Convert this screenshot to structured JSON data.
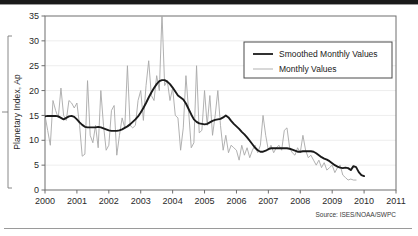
{
  "figure": {
    "source_note": "Source: ISES/NOAA/SWPC",
    "top_rule_color": "#1a1a1a",
    "rule_color": "#9a9a9a"
  },
  "chart_data": {
    "type": "line",
    "title": "",
    "subtitle": "",
    "xlabel": "",
    "ylabel": "Planetary Index, Ap",
    "xlim": [
      2000,
      2011
    ],
    "ylim": [
      0,
      35
    ],
    "xticks": [
      2000,
      2001,
      2002,
      2003,
      2004,
      2005,
      2006,
      2007,
      2008,
      2009,
      2010,
      2011
    ],
    "xtick_labels": [
      "2000",
      "2001",
      "2002",
      "2003",
      "2004",
      "2005",
      "2006",
      "2007",
      "2008",
      "2009",
      "2010",
      "2011"
    ],
    "yticks": [
      0,
      5,
      10,
      15,
      20,
      25,
      30,
      35
    ],
    "ytick_labels": [
      "0",
      "5",
      "10",
      "15",
      "20",
      "25",
      "30",
      "35"
    ],
    "grid": "horizontal",
    "grid_color": "#e8e8e8",
    "frame_color": "#6e6e6e",
    "legend_position": "upper-right",
    "legend_entries": [
      {
        "label": "Smoothed Monthly Values",
        "color": "#1a1a1a",
        "width": 1.8
      },
      {
        "label": "Monthly Values",
        "color": "#a8a8a8",
        "width": 0.9
      }
    ],
    "series": [
      {
        "name": "Monthly Values",
        "color": "#a8a8a8",
        "x_start": 2000.0,
        "x_step": 0.08333,
        "values": [
          15.0,
          12.0,
          9.0,
          18.0,
          16.0,
          14.5,
          20.5,
          15.0,
          14.0,
          18.0,
          17.5,
          16.5,
          17.5,
          13.0,
          6.8,
          7.2,
          22.0,
          11.0,
          9.5,
          13.0,
          8.5,
          20.0,
          13.0,
          8.0,
          9.0,
          16.0,
          17.0,
          7.0,
          11.0,
          14.5,
          12.5,
          25.0,
          13.0,
          12.5,
          13.0,
          18.0,
          20.0,
          14.0,
          21.0,
          26.0,
          19.0,
          18.0,
          23.0,
          20.0,
          35.5,
          21.0,
          22.0,
          18.0,
          20.5,
          15.0,
          14.5,
          8.0,
          12.5,
          23.0,
          16.0,
          8.5,
          9.5,
          25.0,
          11.5,
          12.0,
          20.0,
          13.0,
          19.0,
          11.0,
          15.0,
          20.0,
          13.0,
          8.0,
          11.0,
          7.5,
          9.0,
          8.5,
          8.0,
          6.0,
          9.0,
          7.0,
          8.5,
          6.5,
          8.0,
          9.0,
          7.5,
          9.0,
          15.0,
          11.0,
          8.0,
          9.0,
          7.5,
          8.5,
          9.0,
          8.0,
          12.0,
          12.5,
          8.5,
          7.5,
          7.0,
          8.5,
          7.5,
          11.0,
          8.0,
          6.5,
          7.0,
          6.0,
          5.0,
          6.0,
          4.5,
          5.5,
          4.0,
          4.5,
          5.0,
          3.5,
          4.5,
          5.0,
          3.0,
          2.5,
          2.0,
          2.2,
          2.0,
          2.0
        ]
      },
      {
        "name": "Smoothed Monthly Values",
        "color": "#1a1a1a",
        "x_start": 2000.0,
        "x_step": 0.08333,
        "values": [
          14.8,
          14.9,
          14.9,
          14.9,
          14.9,
          14.8,
          14.5,
          14.2,
          14.5,
          14.8,
          14.9,
          14.7,
          14.2,
          13.6,
          13.1,
          12.7,
          12.6,
          12.6,
          12.6,
          12.6,
          12.7,
          12.6,
          12.4,
          12.2,
          12.0,
          11.9,
          11.9,
          11.9,
          12.0,
          12.2,
          12.5,
          12.8,
          13.2,
          13.7,
          14.2,
          14.8,
          15.6,
          16.5,
          17.5,
          18.6,
          19.6,
          20.5,
          21.3,
          21.9,
          22.1,
          22.1,
          21.8,
          21.3,
          20.6,
          19.8,
          19.0,
          18.6,
          18.2,
          17.4,
          16.3,
          15.2,
          14.2,
          13.7,
          13.4,
          13.3,
          13.2,
          13.3,
          13.6,
          13.9,
          14.1,
          14.2,
          14.3,
          14.6,
          15.0,
          14.6,
          13.9,
          13.3,
          12.8,
          12.3,
          11.7,
          11.2,
          10.6,
          9.9,
          9.2,
          8.5,
          8.0,
          7.7,
          7.7,
          7.9,
          8.2,
          8.4,
          8.4,
          8.4,
          8.4,
          8.4,
          8.4,
          8.4,
          8.3,
          8.1,
          7.9,
          7.7,
          7.7,
          7.8,
          7.8,
          7.8,
          7.8,
          7.7,
          7.4,
          7.0,
          6.6,
          6.3,
          6.1,
          5.8,
          5.4,
          5.0,
          4.7,
          4.5,
          4.4,
          4.5,
          4.4,
          4.0,
          4.8,
          4.6,
          3.6,
          3.0,
          2.8
        ]
      }
    ]
  }
}
